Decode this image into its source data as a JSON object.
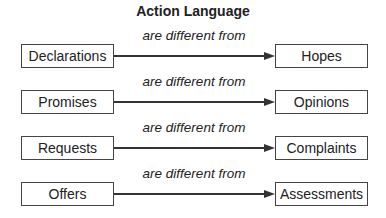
{
  "title": "Action Language",
  "rows": [
    {
      "left": "Declarations",
      "relation": "are different from",
      "right": "Hopes"
    },
    {
      "left": "Promises",
      "relation": "are different from",
      "right": "Opinions"
    },
    {
      "left": "Requests",
      "relation": "are different from",
      "right": "Complaints"
    },
    {
      "left": "Offers",
      "relation": "are different from",
      "right": "Assessments"
    }
  ]
}
